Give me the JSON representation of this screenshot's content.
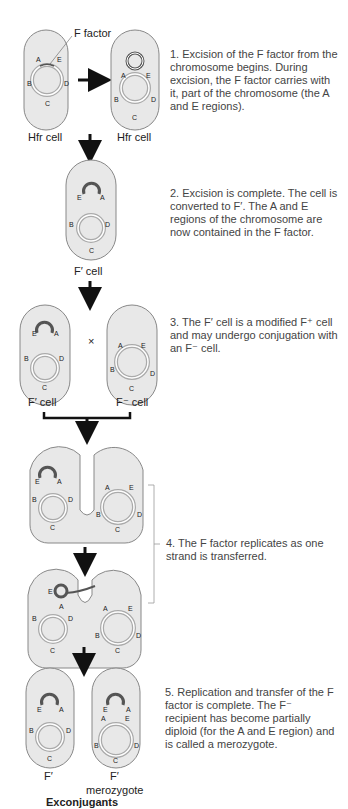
{
  "figure": {
    "colors": {
      "cell_fill": "#e8e8e8",
      "cell_stroke": "#888888",
      "dna_stroke": "#999999",
      "arrow": "#111111",
      "text": "#444444"
    },
    "labels": {
      "f_factor": "F factor",
      "hfr_cell_1": "Hfr cell",
      "hfr_cell_2": "Hfr cell",
      "fprime_cell_step2": "F′ cell",
      "fprime_cell_step3": "F′ cell",
      "fminus_cell_step3": "F⁻ cell",
      "cross_symbol": "×",
      "fprime_exconjugant": "F′",
      "merozygote_fprime": "F′",
      "merozygote": "merozygote",
      "exconjugants": "Exconjugants"
    },
    "genes": [
      "A",
      "B",
      "C",
      "D",
      "E"
    ],
    "steps": [
      {
        "id": 1,
        "text": "1. Excision of the F factor from the chromosome begins. During excision, the F factor carries with it, part of the chromosome (the A and E regions)."
      },
      {
        "id": 2,
        "text": "2. Excision is complete. The cell is converted to F′. The A and E regions of the chromosome are now contained in the F factor."
      },
      {
        "id": 3,
        "text": "3. The F′ cell is a modified F⁺ cell and may undergo conjugation with an F⁻ cell."
      },
      {
        "id": 4,
        "text": "4. The F factor replicates as one strand is transferred."
      },
      {
        "id": 5,
        "text": "5. Replication and transfer of the F factor is complete. The F⁻ recipient has become partially diploid (for the A and E region) and is called a merozygote."
      }
    ]
  }
}
